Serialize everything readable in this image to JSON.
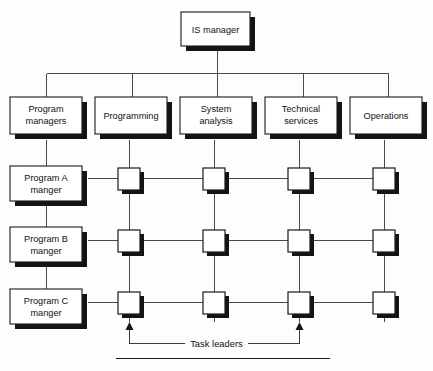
{
  "diagram": {
    "type": "org-chart",
    "colors": {
      "box_fill": "#ffffff",
      "box_stroke": "#1a1a1a",
      "shadow": "#141414",
      "connector": "#4a4a4a",
      "background": "#fdfdfb"
    }
  },
  "top": {
    "label": "IS manager"
  },
  "departments": [
    {
      "label_line1": "Program",
      "label_line2": "managers"
    },
    {
      "label_line1": "Programming",
      "label_line2": ""
    },
    {
      "label_line1": "System",
      "label_line2": "analysis"
    },
    {
      "label_line1": "Technical",
      "label_line2": "services"
    },
    {
      "label_line1": "Operations",
      "label_line2": ""
    }
  ],
  "programs": [
    {
      "label_line1": "Program A",
      "label_line2": "manger"
    },
    {
      "label_line1": "Program B",
      "label_line2": "manger"
    },
    {
      "label_line1": "Program C",
      "label_line2": "manger"
    }
  ],
  "matrix": {
    "rows": 3,
    "columns": 4,
    "column_departments": [
      "Programming",
      "System analysis",
      "Technical services",
      "Operations"
    ],
    "row_programs": [
      "Program A manger",
      "Program B manger",
      "Program C manger"
    ],
    "cells": [
      [
        {
          "filled": true
        },
        {
          "filled": true
        },
        {
          "filled": true
        },
        {
          "filled": true
        }
      ],
      [
        {
          "filled": true
        },
        {
          "filled": true
        },
        {
          "filled": true
        },
        {
          "filled": true
        }
      ],
      [
        {
          "filled": true
        },
        {
          "filled": true
        },
        {
          "filled": true
        },
        {
          "filled": true
        }
      ]
    ]
  },
  "callout": {
    "label": "Task leaders",
    "points_to_columns": [
      1,
      3
    ]
  }
}
